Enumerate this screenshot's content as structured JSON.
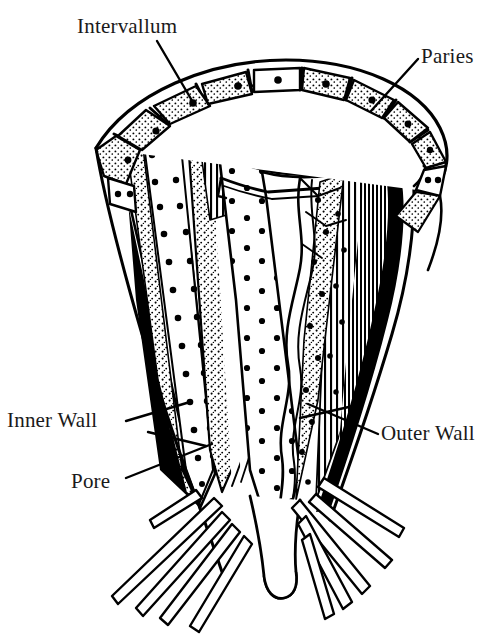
{
  "figure": {
    "background_color": "#ffffff",
    "ink_color": "#000000",
    "text_color": "#1a1a1a",
    "width": 501,
    "height": 634
  },
  "labels": {
    "intervallum": "Intervallum",
    "paries": "Paries",
    "inner_wall": "Inner Wall",
    "pore": "Pore",
    "outer_wall": "Outer Wall"
  },
  "leader_lines": {
    "intervallum": "leader-line-intervallum",
    "paries": "leader-line-paries",
    "inner_wall": "leader-line-inner-wall",
    "pore": "leader-line-pore",
    "outer_wall": "leader-line-outer-wall"
  },
  "structures": {
    "rim": "segmented-rim-chambers",
    "inner_cavity": "central-cavity-stipple",
    "left_wall": "inner-wall-stippled-band",
    "right_wall": "outer-wall-hatched-shaded-band",
    "base": "root-holdfast-spicules"
  }
}
